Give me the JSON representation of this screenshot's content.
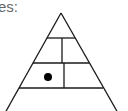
{
  "caption": {
    "text": "es:"
  },
  "diagram": {
    "type": "pyramid",
    "stroke_color": "#1a1a1a",
    "dot_color": "#000000",
    "rows": 4,
    "marked_cell": {
      "row": 3,
      "cell": 1
    }
  }
}
